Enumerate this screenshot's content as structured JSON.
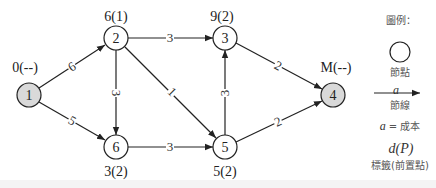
{
  "diagram": {
    "type": "shortest-path-network",
    "colors": {
      "line": "#222222",
      "node_fill_default": "#ffffff",
      "node_fill_terminal": "#d9d9d9"
    },
    "nodes": [
      {
        "id": "1",
        "label": "0(--)",
        "terminal": true
      },
      {
        "id": "2",
        "label": "6(1)",
        "terminal": false
      },
      {
        "id": "3",
        "label": "9(2)",
        "terminal": false
      },
      {
        "id": "4",
        "label": "M(--)",
        "terminal": true
      },
      {
        "id": "5",
        "label": "5(2)",
        "terminal": false
      },
      {
        "id": "6",
        "label": "3(2)",
        "terminal": false
      }
    ],
    "edges": [
      {
        "from": "1",
        "to": "2",
        "cost": "6"
      },
      {
        "from": "1",
        "to": "6",
        "cost": "5"
      },
      {
        "from": "2",
        "to": "3",
        "cost": "3"
      },
      {
        "from": "2",
        "to": "6",
        "cost": "3"
      },
      {
        "from": "2",
        "to": "5",
        "cost": "1"
      },
      {
        "from": "6",
        "to": "5",
        "cost": "3"
      },
      {
        "from": "5",
        "to": "3",
        "cost": "3"
      },
      {
        "from": "3",
        "to": "4",
        "cost": "2"
      },
      {
        "from": "5",
        "to": "4",
        "cost": "2"
      }
    ]
  },
  "legend": {
    "title": "圖例：",
    "node_caption": "節點",
    "arc_symbol": "a",
    "arc_caption": "節線",
    "cost_var": "a",
    "cost_eq": " = 成本",
    "label_symbol": "d(P)",
    "label_caption": "標籤(前置點)"
  }
}
